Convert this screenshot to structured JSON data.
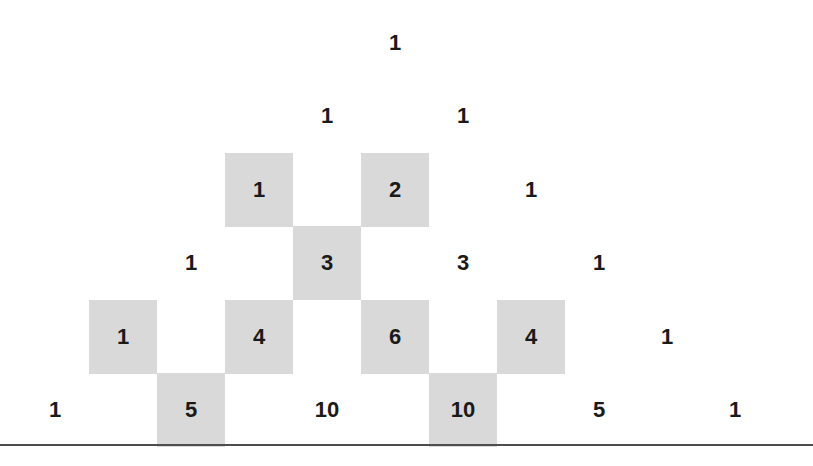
{
  "figure": {
    "background_color": "#ffffff",
    "shade_color": "#d9d9d9",
    "text_color": "#1a1a1a",
    "baseline_color": "#4d4d4d",
    "baseline_y": 444,
    "cell_width": 68,
    "cell_height": 74,
    "col_step": 68,
    "row_step": 73.5,
    "origin_x": 395,
    "origin_y": 6
  },
  "chart_data": {
    "type": "table",
    "xlabel": "",
    "ylabel": "",
    "grid": false,
    "legend": "none",
    "rows": [
      {
        "row": 0,
        "values": [
          1
        ],
        "shaded": [
          false
        ]
      },
      {
        "row": 1,
        "values": [
          1,
          1
        ],
        "shaded": [
          false,
          false
        ]
      },
      {
        "row": 2,
        "values": [
          1,
          2,
          1
        ],
        "shaded": [
          true,
          true,
          false
        ]
      },
      {
        "row": 3,
        "values": [
          1,
          3,
          3,
          1
        ],
        "shaded": [
          false,
          true,
          false,
          false
        ]
      },
      {
        "row": 4,
        "values": [
          1,
          4,
          6,
          4,
          1
        ],
        "shaded": [
          true,
          true,
          true,
          true,
          false
        ]
      },
      {
        "row": 5,
        "values": [
          1,
          5,
          10,
          10,
          5,
          1
        ],
        "shaded": [
          false,
          true,
          false,
          true,
          false,
          false
        ]
      }
    ]
  },
  "cells": [
    {
      "text": "1",
      "row": 0,
      "col": 0,
      "shaded": false,
      "x": 361,
      "y": 6
    },
    {
      "text": "1",
      "row": 1,
      "col": 0,
      "shaded": false,
      "x": 293,
      "y": 79
    },
    {
      "text": "1",
      "row": 1,
      "col": 1,
      "shaded": false,
      "x": 429,
      "y": 79
    },
    {
      "text": "1",
      "row": 2,
      "col": 0,
      "shaded": true,
      "x": 225,
      "y": 153
    },
    {
      "text": "2",
      "row": 2,
      "col": 1,
      "shaded": true,
      "x": 361,
      "y": 153
    },
    {
      "text": "1",
      "row": 2,
      "col": 2,
      "shaded": false,
      "x": 497,
      "y": 153
    },
    {
      "text": "1",
      "row": 3,
      "col": 0,
      "shaded": false,
      "x": 157,
      "y": 226
    },
    {
      "text": "3",
      "row": 3,
      "col": 1,
      "shaded": true,
      "x": 293,
      "y": 226
    },
    {
      "text": "3",
      "row": 3,
      "col": 2,
      "shaded": false,
      "x": 429,
      "y": 226
    },
    {
      "text": "1",
      "row": 3,
      "col": 3,
      "shaded": false,
      "x": 565,
      "y": 226
    },
    {
      "text": "1",
      "row": 4,
      "col": 0,
      "shaded": true,
      "x": 89,
      "y": 300
    },
    {
      "text": "4",
      "row": 4,
      "col": 1,
      "shaded": true,
      "x": 225,
      "y": 300
    },
    {
      "text": "6",
      "row": 4,
      "col": 2,
      "shaded": true,
      "x": 361,
      "y": 300
    },
    {
      "text": "4",
      "row": 4,
      "col": 3,
      "shaded": true,
      "x": 497,
      "y": 300
    },
    {
      "text": "1",
      "row": 4,
      "col": 4,
      "shaded": false,
      "x": 633,
      "y": 300
    },
    {
      "text": "1",
      "row": 5,
      "col": 0,
      "shaded": false,
      "x": 21,
      "y": 373
    },
    {
      "text": "5",
      "row": 5,
      "col": 1,
      "shaded": true,
      "x": 157,
      "y": 373
    },
    {
      "text": "10",
      "row": 5,
      "col": 2,
      "shaded": false,
      "x": 293,
      "y": 373
    },
    {
      "text": "10",
      "row": 5,
      "col": 3,
      "shaded": true,
      "x": 429,
      "y": 373
    },
    {
      "text": "5",
      "row": 5,
      "col": 4,
      "shaded": false,
      "x": 565,
      "y": 373
    },
    {
      "text": "1",
      "row": 5,
      "col": 5,
      "shaded": false,
      "x": 701,
      "y": 373
    }
  ]
}
